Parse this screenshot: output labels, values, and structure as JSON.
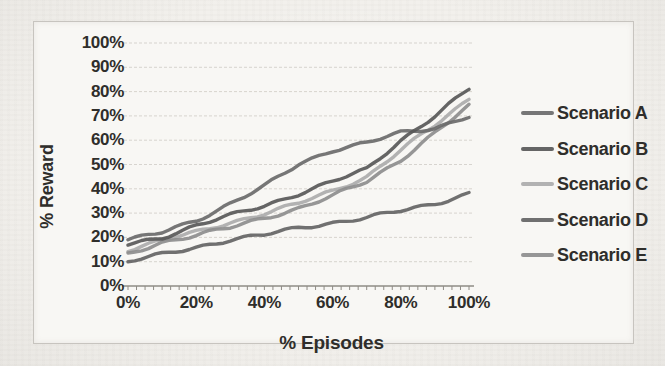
{
  "figure": {
    "page_bg": "#f2f0ec",
    "frame_bg": "#f8f7f4",
    "frame_border": "#c7c4bf",
    "text_color": "#2f2e2b",
    "grid_color": "#d4d1cb",
    "axis_color": "#8f8c86"
  },
  "chart_data": {
    "type": "line",
    "title": "",
    "xlabel": "% Episodes",
    "ylabel": "% Reward",
    "x_tick_labels": [
      "0%",
      "20%",
      "40%",
      "60%",
      "80%",
      "100%"
    ],
    "x_tick_values": [
      0,
      20,
      40,
      60,
      80,
      100
    ],
    "y_tick_labels": [
      "100%",
      "90%",
      "80%",
      "70%",
      "60%",
      "50%",
      "40%",
      "30%",
      "20%",
      "10%",
      "0%"
    ],
    "y_tick_values": [
      100,
      90,
      80,
      70,
      60,
      50,
      40,
      30,
      20,
      10,
      0
    ],
    "xlim": [
      0,
      100
    ],
    "ylim": [
      0,
      100
    ],
    "grid": "horizontal",
    "legend_position": "right",
    "x": [
      0,
      10,
      20,
      30,
      40,
      50,
      60,
      70,
      80,
      90,
      100
    ],
    "series": [
      {
        "name": "Scenario A",
        "color": "#6a6a6a",
        "values": [
          19,
          22,
          27,
          34,
          41,
          50,
          56,
          59,
          63,
          65,
          70
        ]
      },
      {
        "name": "Scenario B",
        "color": "#585858",
        "values": [
          17,
          20,
          25,
          29,
          33,
          38,
          43,
          48,
          60,
          70,
          81
        ]
      },
      {
        "name": "Scenario C",
        "color": "#ababab",
        "values": [
          15,
          19,
          22,
          26,
          30,
          34,
          39,
          45,
          56,
          66,
          77
        ]
      },
      {
        "name": "Scenario D",
        "color": "#646464",
        "values": [
          10,
          13,
          16,
          19,
          21,
          24,
          26,
          28,
          31,
          34,
          38
        ]
      },
      {
        "name": "Scenario E",
        "color": "#8d8d8d",
        "values": [
          13,
          18,
          21,
          24,
          28,
          32,
          37,
          43,
          52,
          63,
          74
        ]
      }
    ]
  }
}
